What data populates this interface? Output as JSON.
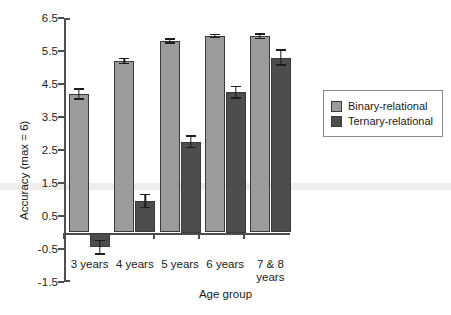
{
  "chart_data": {
    "type": "bar",
    "title": "",
    "xlabel": "Age group",
    "ylabel": "Accuracy (max = 6)",
    "categories": [
      "3 years",
      "4 years",
      "5 years",
      "6 years",
      "7 & 8\nyears"
    ],
    "ylim": [
      -1.5,
      6.5
    ],
    "yticks": [
      6.5,
      5.5,
      4.5,
      3.5,
      2.5,
      1.5,
      0.5,
      -0.5,
      -1.5
    ],
    "ytick_labels": [
      "6.5",
      "5.5",
      "4.5",
      "3.5",
      "2.5",
      "1.5",
      "0.5",
      "-0.5",
      "-1.5"
    ],
    "grid": false,
    "legend_position": "right",
    "series": [
      {
        "name": "Binary-relational",
        "color": "#9b9b9b",
        "values": [
          4.2,
          5.2,
          5.8,
          5.95,
          5.95
        ],
        "errors": [
          0.17,
          0.1,
          0.08,
          0.07,
          0.09
        ]
      },
      {
        "name": "Ternary-relational",
        "color": "#4d4d4d",
        "values": [
          -0.45,
          0.95,
          2.75,
          4.25,
          5.3
        ],
        "errors": [
          0.22,
          0.22,
          0.2,
          0.2,
          0.25
        ]
      }
    ]
  },
  "legend": {
    "items": [
      {
        "label": "Binary-relational",
        "swatch": "binary"
      },
      {
        "label": "Ternary-relational",
        "swatch": "ternary"
      }
    ]
  },
  "axes": {
    "x_title": "Age group",
    "y_title": "Accuracy (max = 6)"
  }
}
